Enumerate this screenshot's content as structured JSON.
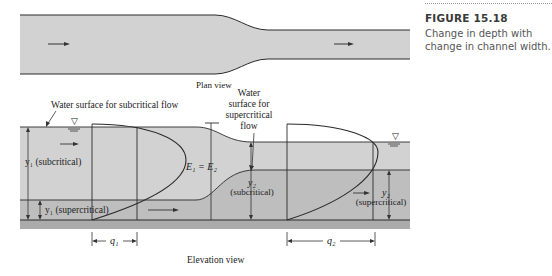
{
  "figure": {
    "number": "FIGURE 15.18",
    "caption": "Change in depth with change in channel width."
  },
  "plan_view": {
    "label": "Plan view"
  },
  "elevation_view": {
    "label": "Elevation view",
    "annotations": {
      "subcritical_surface": "Water surface for subcritical flow",
      "supercritical_surface_line1": "Water",
      "supercritical_surface_line2": "surface for",
      "supercritical_surface_line3": "supercritical",
      "supercritical_surface_line4": "flow",
      "energy": "E₁ = E₂",
      "y1_sub": "y₁ (subcritical)",
      "y1_super": "y₁ (supercritical)",
      "y2_sub_symbol": "y₂",
      "y2_sub_label": "(subcritical)",
      "y2_super_symbol": "y₂",
      "y2_super_label": "(supercritical)",
      "q1": "q₁",
      "q2": "q₂"
    },
    "water_surface_symbol": "▽"
  },
  "colors": {
    "water_light": "#d2d2d2",
    "water_dark": "#bdbdbd",
    "bed": "#a9a9a9",
    "line": "#2a2a2a"
  }
}
